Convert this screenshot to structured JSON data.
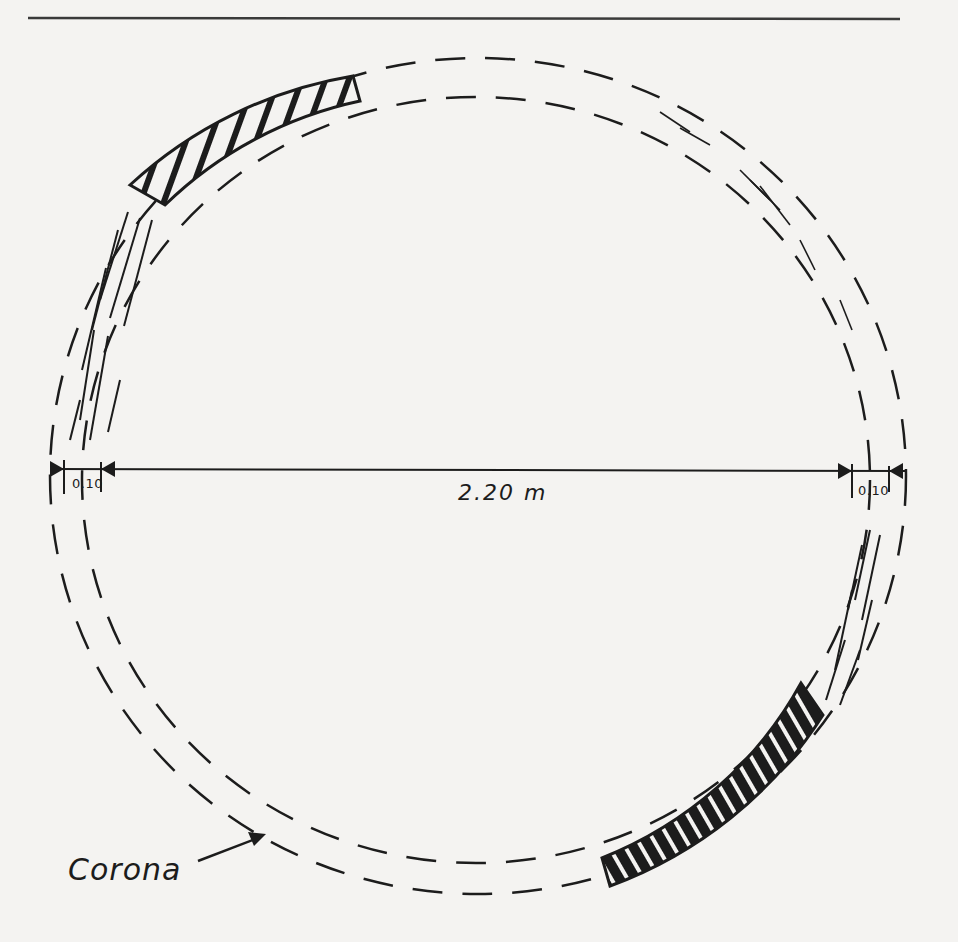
{
  "figure": {
    "type": "plan drawing of a ring with surviving corona segments",
    "labels": {
      "overall_diameter": "2.20 m",
      "ring_width_left": "0.10",
      "ring_width_right": "0.10",
      "corona": "Corona"
    },
    "elements": [
      "top horizontal rule",
      "outer dashed circle",
      "inner dashed circle",
      "upper-left hatched corona segment",
      "lower-right hatched corona segment",
      "sketchy fragment traces along ring",
      "horizontal dimension line with arrowheads",
      "arrow pointing from Corona label to ring"
    ],
    "colors": {
      "ink": "#1c1c1c",
      "paper": "#f4f3f1"
    }
  }
}
